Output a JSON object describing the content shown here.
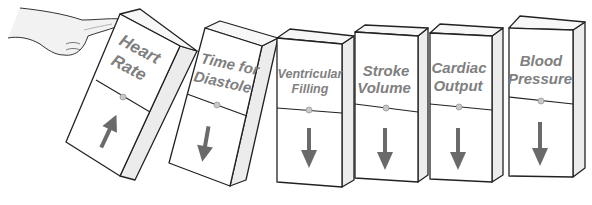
{
  "diagram": {
    "type": "domino-chain",
    "pusher": {
      "icon": "pointing-hand-icon"
    },
    "dominoes": [
      {
        "id": "heart-rate",
        "line1": "Heart",
        "line2": "Rate",
        "direction": "up"
      },
      {
        "id": "time-for-diastole",
        "line1": "Time for",
        "line2": "Diastole",
        "direction": "down"
      },
      {
        "id": "ventricular-filling",
        "line1": "Ventricular",
        "line2": "Filling",
        "direction": "down"
      },
      {
        "id": "stroke-volume",
        "line1": "Stroke",
        "line2": "Volume",
        "direction": "down"
      },
      {
        "id": "cardiac-output",
        "line1": "Cardiac",
        "line2": "Output",
        "direction": "down"
      },
      {
        "id": "blood-pressure",
        "line1": "Blood",
        "line2": "Pressure",
        "direction": "down"
      }
    ],
    "colors": {
      "text": "#7f7f7f",
      "arrow": "#6a6a6a",
      "outline": "#222222",
      "side": "#ececec"
    }
  }
}
